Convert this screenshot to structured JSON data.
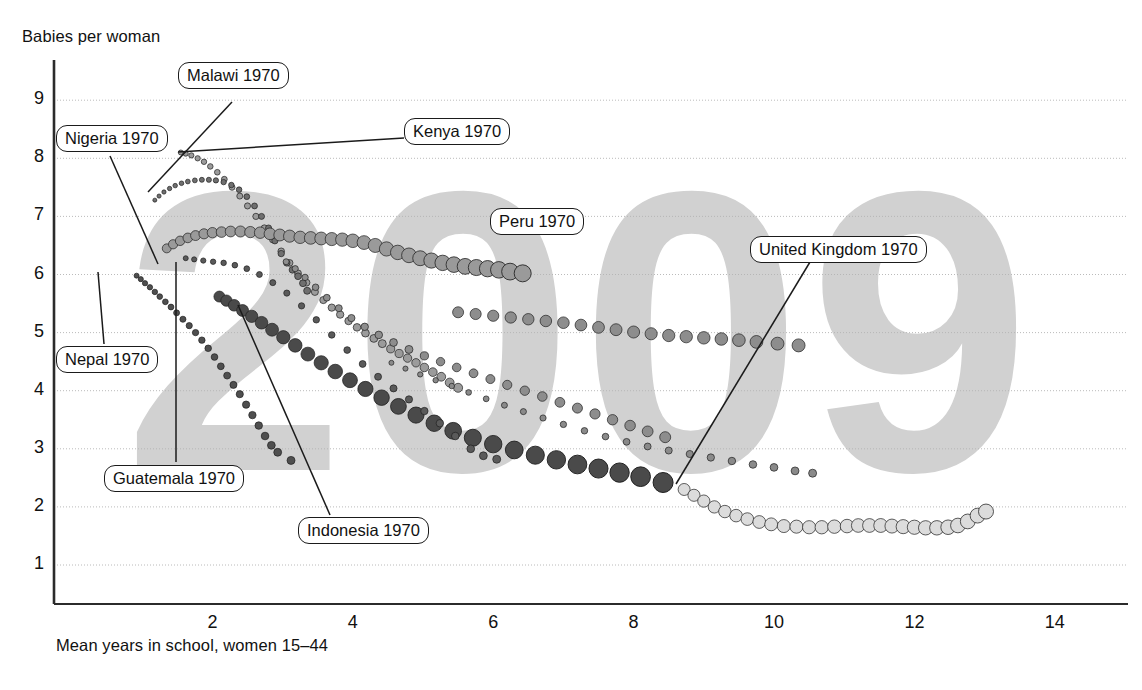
{
  "chart_data": {
    "type": "scatter",
    "title": "",
    "subtitle": "",
    "xlabel": "Mean years in school, women 15–44",
    "ylabel": "Babies per woman",
    "xlim": [
      0.3,
      15.0
    ],
    "ylim": [
      0.55,
      9.45
    ],
    "xticks": [
      2,
      4,
      6,
      8,
      10,
      12,
      14
    ],
    "yticks": [
      1,
      2,
      3,
      4,
      5,
      6,
      7,
      8,
      9
    ],
    "grid": "horizontal dotted gridlines at each y tick",
    "legend": "none (inline callout labels with leader lines)",
    "watermark": "2009",
    "annotations": [
      {
        "label": "Malawi 1970",
        "box_x": 178,
        "box_y": 62,
        "anchor_x": 148,
        "anchor_y": 192
      },
      {
        "label": "Nigeria 1970",
        "box_x": 56,
        "box_y": 125,
        "anchor_x": 155,
        "anchor_y": 262
      },
      {
        "label": "Kenya 1970",
        "box_x": 404,
        "box_y": 118,
        "anchor_x": 175,
        "anchor_y": 152
      },
      {
        "label": "Peru 1970",
        "box_x": 490,
        "box_y": 208,
        "anchor_x": 490,
        "anchor_y": 208
      },
      {
        "label": "United Kingdom 1970",
        "box_x": 750,
        "box_y": 236,
        "anchor_x": 676,
        "anchor_y": 484
      },
      {
        "label": "Nepal 1970",
        "box_x": 56,
        "box_y": 346,
        "anchor_x": 98,
        "anchor_y": 272
      },
      {
        "label": "Guatemala 1970",
        "box_x": 104,
        "box_y": 465,
        "anchor_x": 175,
        "anchor_y": 262
      },
      {
        "label": "Indonesia 1970",
        "box_x": 298,
        "box_y": 517,
        "anchor_x": 238,
        "anchor_y": 305
      }
    ],
    "series": [
      {
        "name": "Kenya 1970",
        "color": "#9b9b9b",
        "start": {
          "x": 1.55,
          "y": 8.1
        },
        "end": {
          "x": 5.5,
          "y": 4.05
        },
        "points_x": [
          1.55,
          1.62,
          1.7,
          1.79,
          1.88,
          1.97,
          2.07,
          2.17,
          2.28,
          2.39,
          2.5,
          2.62,
          2.74,
          2.86,
          2.98,
          3.1,
          3.22,
          3.34,
          3.46,
          3.58,
          3.7,
          3.82,
          3.94,
          4.06,
          4.18,
          4.3,
          4.42,
          4.54,
          4.66,
          4.78,
          4.9,
          5.02,
          5.14,
          5.26,
          5.38,
          5.5
        ],
        "points_y": [
          8.1,
          8.08,
          8.05,
          8.0,
          7.94,
          7.86,
          7.76,
          7.64,
          7.5,
          7.35,
          7.18,
          7.0,
          6.8,
          6.6,
          6.4,
          6.2,
          6.02,
          5.86,
          5.7,
          5.56,
          5.43,
          5.31,
          5.2,
          5.09,
          4.99,
          4.9,
          4.81,
          4.72,
          4.64,
          4.56,
          4.48,
          4.4,
          4.32,
          4.24,
          4.14,
          4.05
        ],
        "size_start": 5,
        "size_end": 9
      },
      {
        "name": "Malawi 1970",
        "color": "#6f6f6f",
        "start": {
          "x": 1.18,
          "y": 7.28
        },
        "end": {
          "x": 3.35,
          "y": 5.72
        },
        "points_x": [
          1.18,
          1.24,
          1.31,
          1.39,
          1.47,
          1.56,
          1.65,
          1.75,
          1.85,
          1.95,
          2.05,
          2.16,
          2.27,
          2.38,
          2.49,
          2.6,
          2.7,
          2.8,
          2.89,
          2.98,
          3.06,
          3.14,
          3.22,
          3.29,
          3.35
        ],
        "points_y": [
          7.28,
          7.35,
          7.42,
          7.48,
          7.53,
          7.57,
          7.6,
          7.62,
          7.63,
          7.63,
          7.62,
          7.59,
          7.54,
          7.46,
          7.34,
          7.18,
          7.0,
          6.8,
          6.58,
          6.36,
          6.2,
          6.08,
          5.97,
          5.85,
          5.72
        ],
        "size_start": 4,
        "size_end": 7
      },
      {
        "name": "Nigeria 1970",
        "color": "#9a9a9a",
        "start": {
          "x": 1.35,
          "y": 6.45
        },
        "end": {
          "x": 6.42,
          "y": 6.02
        },
        "points_x": [
          1.35,
          1.44,
          1.54,
          1.65,
          1.76,
          1.88,
          2.0,
          2.13,
          2.26,
          2.4,
          2.54,
          2.68,
          2.82,
          2.96,
          3.1,
          3.25,
          3.4,
          3.55,
          3.7,
          3.85,
          4.0,
          4.16,
          4.32,
          4.48,
          4.64,
          4.8,
          4.96,
          5.12,
          5.28,
          5.44,
          5.6,
          5.76,
          5.92,
          6.08,
          6.24,
          6.42
        ],
        "points_y": [
          6.45,
          6.52,
          6.58,
          6.63,
          6.67,
          6.7,
          6.72,
          6.73,
          6.74,
          6.74,
          6.73,
          6.72,
          6.7,
          6.68,
          6.66,
          6.64,
          6.63,
          6.62,
          6.61,
          6.6,
          6.58,
          6.55,
          6.5,
          6.44,
          6.38,
          6.33,
          6.28,
          6.24,
          6.2,
          6.17,
          6.14,
          6.12,
          6.1,
          6.08,
          6.05,
          6.02
        ],
        "size_start": 9,
        "size_end": 17
      },
      {
        "name": "Peru 1970",
        "color": "#8d8d8d",
        "start": {
          "x": 3.05,
          "y": 6.22
        },
        "end": {
          "x": 8.45,
          "y": 2.42
        },
        "points_x": [
          3.05,
          3.18,
          3.32,
          3.47,
          3.63,
          3.8,
          3.98,
          4.17,
          4.37,
          4.58,
          4.8,
          5.02,
          5.25,
          5.48,
          5.72,
          5.96,
          6.2,
          6.45,
          6.7,
          6.95,
          7.2,
          7.45,
          7.7,
          7.95,
          8.2,
          8.45
        ],
        "points_y": [
          6.22,
          6.1,
          5.95,
          5.78,
          5.6,
          5.42,
          5.25,
          5.1,
          4.96,
          4.83,
          4.71,
          4.6,
          4.5,
          4.4,
          4.3,
          4.2,
          4.1,
          4.0,
          3.9,
          3.8,
          3.7,
          3.6,
          3.5,
          3.4,
          3.3,
          3.2
        ],
        "size_start": 6,
        "size_end": 11
      },
      {
        "name": "Peru tail",
        "color": "#8d8d8d",
        "start": {
          "x": 5.5,
          "y": 5.35
        },
        "end": {
          "x": 10.35,
          "y": 4.78
        },
        "points_x": [
          5.5,
          5.75,
          6.0,
          6.25,
          6.5,
          6.75,
          7.0,
          7.25,
          7.5,
          7.75,
          8.0,
          8.25,
          8.5,
          8.75,
          9.0,
          9.25,
          9.5,
          9.75,
          10.05,
          10.35
        ],
        "points_y": [
          5.35,
          5.32,
          5.29,
          5.26,
          5.23,
          5.2,
          5.17,
          5.13,
          5.09,
          5.05,
          5.01,
          4.98,
          4.95,
          4.93,
          4.91,
          4.89,
          4.87,
          4.84,
          4.81,
          4.78
        ],
        "size_start": 11,
        "size_end": 13
      },
      {
        "name": "Indonesia 1970",
        "color": "#4a4a4a",
        "start": {
          "x": 2.1,
          "y": 5.62
        },
        "end": {
          "x": 8.42,
          "y": 2.42
        },
        "points_x": [
          2.1,
          2.2,
          2.31,
          2.43,
          2.56,
          2.7,
          2.85,
          3.01,
          3.18,
          3.36,
          3.55,
          3.75,
          3.96,
          4.18,
          4.41,
          4.65,
          4.9,
          5.16,
          5.43,
          5.71,
          6.0,
          6.3,
          6.6,
          6.9,
          7.2,
          7.5,
          7.8,
          8.1,
          8.42
        ],
        "points_y": [
          5.62,
          5.55,
          5.47,
          5.38,
          5.28,
          5.17,
          5.05,
          4.92,
          4.78,
          4.63,
          4.48,
          4.33,
          4.18,
          4.03,
          3.88,
          3.73,
          3.58,
          3.44,
          3.31,
          3.19,
          3.08,
          2.98,
          2.89,
          2.81,
          2.73,
          2.66,
          2.59,
          2.52,
          2.42
        ],
        "size_start": 11,
        "size_end": 20
      },
      {
        "name": "Guatemala 1970",
        "color": "#5a5a5a",
        "start": {
          "x": 1.62,
          "y": 6.28
        },
        "end": {
          "x": 6.05,
          "y": 2.82
        },
        "points_x": [
          1.62,
          1.74,
          1.87,
          2.01,
          2.16,
          2.32,
          2.49,
          2.67,
          2.86,
          3.06,
          3.27,
          3.48,
          3.7,
          3.92,
          4.14,
          4.36,
          4.58,
          4.8,
          5.02,
          5.24,
          5.46,
          5.68,
          5.86,
          6.05
        ],
        "points_y": [
          6.28,
          6.26,
          6.24,
          6.22,
          6.2,
          6.16,
          6.1,
          6.0,
          5.86,
          5.68,
          5.46,
          5.22,
          4.96,
          4.7,
          4.46,
          4.24,
          4.04,
          3.85,
          3.65,
          3.44,
          3.22,
          3.0,
          2.88,
          2.82
        ],
        "size_start": 5,
        "size_end": 8
      },
      {
        "name": "Nepal 1970",
        "color": "#4f4f4f",
        "start": {
          "x": 0.92,
          "y": 5.98
        },
        "end": {
          "x": 3.12,
          "y": 2.8
        },
        "points_x": [
          0.92,
          0.98,
          1.04,
          1.11,
          1.18,
          1.25,
          1.33,
          1.41,
          1.49,
          1.58,
          1.67,
          1.76,
          1.85,
          1.94,
          2.03,
          2.12,
          2.21,
          2.3,
          2.39,
          2.48,
          2.57,
          2.66,
          2.75,
          2.84,
          2.93,
          3.12
        ],
        "points_y": [
          5.98,
          5.92,
          5.85,
          5.78,
          5.7,
          5.62,
          5.53,
          5.44,
          5.34,
          5.23,
          5.12,
          5.0,
          4.87,
          4.73,
          4.58,
          4.42,
          4.26,
          4.1,
          3.94,
          3.76,
          3.58,
          3.4,
          3.22,
          3.06,
          2.94,
          2.8
        ],
        "size_start": 5,
        "size_end": 8
      },
      {
        "name": "United Kingdom 1970",
        "color": "#dcdcdc",
        "start": {
          "x": 8.72,
          "y": 2.3
        },
        "end": {
          "x": 13.02,
          "y": 1.92
        },
        "points_x": [
          8.72,
          8.86,
          9.0,
          9.15,
          9.3,
          9.46,
          9.62,
          9.79,
          9.96,
          10.14,
          10.32,
          10.5,
          10.68,
          10.86,
          11.04,
          11.2,
          11.36,
          11.52,
          11.68,
          11.84,
          12.0,
          12.16,
          12.32,
          12.48,
          12.62,
          12.76,
          12.9,
          13.02
        ],
        "points_y": [
          2.3,
          2.2,
          2.1,
          2.0,
          1.92,
          1.85,
          1.79,
          1.74,
          1.7,
          1.67,
          1.66,
          1.65,
          1.65,
          1.66,
          1.67,
          1.68,
          1.68,
          1.68,
          1.67,
          1.66,
          1.65,
          1.64,
          1.64,
          1.65,
          1.68,
          1.75,
          1.85,
          1.92
        ],
        "size_start": 12,
        "size_end": 15
      },
      {
        "name": "grey mid trail",
        "color": "#8a8a8a",
        "start": {
          "x": 4.55,
          "y": 4.48
        },
        "end": {
          "x": 10.55,
          "y": 2.58
        },
        "points_x": [
          4.55,
          4.75,
          4.96,
          5.18,
          5.41,
          5.65,
          5.9,
          6.16,
          6.43,
          6.71,
          7.0,
          7.3,
          7.6,
          7.9,
          8.2,
          8.5,
          8.8,
          9.1,
          9.4,
          9.7,
          10.0,
          10.3,
          10.55
        ],
        "points_y": [
          4.48,
          4.38,
          4.28,
          4.18,
          4.08,
          3.97,
          3.86,
          3.75,
          3.64,
          3.53,
          3.42,
          3.31,
          3.21,
          3.12,
          3.04,
          2.97,
          2.91,
          2.85,
          2.79,
          2.73,
          2.68,
          2.62,
          2.58
        ],
        "size_start": 5,
        "size_end": 8
      }
    ]
  },
  "axis": {
    "y_title": "Babies per woman",
    "x_title": "Mean years in school, women 15–44",
    "y_ticks": [
      "9",
      "8",
      "7",
      "6",
      "5",
      "4",
      "3",
      "2",
      "1"
    ],
    "x_ticks": [
      "2",
      "4",
      "6",
      "8",
      "10",
      "12",
      "14"
    ]
  },
  "watermark": {
    "text": "2009",
    "color": "#c9c9c9"
  },
  "callouts": [
    {
      "id": "malawi",
      "text": "Malawi 1970"
    },
    {
      "id": "nigeria",
      "text": "Nigeria 1970"
    },
    {
      "id": "kenya",
      "text": "Kenya 1970"
    },
    {
      "id": "peru",
      "text": "Peru 1970"
    },
    {
      "id": "uk",
      "text": "United Kingdom 1970"
    },
    {
      "id": "nepal",
      "text": "Nepal 1970"
    },
    {
      "id": "guatemala",
      "text": "Guatemala 1970"
    },
    {
      "id": "indonesia",
      "text": "Indonesia 1970"
    }
  ],
  "colors": {
    "axis": "#2b2b2b",
    "gridline": "#b4b4b4",
    "text": "#111111",
    "callout_border": "#1b1b1b",
    "background": "#ffffff"
  }
}
